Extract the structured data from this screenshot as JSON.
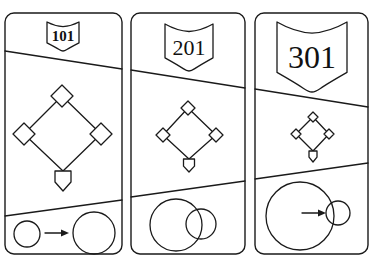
{
  "figure": {
    "colors": {
      "line": "#1a1a1a",
      "background": "#ffffff"
    }
  },
  "panels": [
    {
      "id": "panel-1",
      "shield_label": "101",
      "card": {
        "x": 5,
        "y": 13,
        "w": 117,
        "h": 241,
        "r": 9
      },
      "shield": {
        "cx": 63,
        "top": 22,
        "w": 32,
        "h": 29,
        "font_size": 15
      },
      "divider_top": {
        "x1": 5,
        "y1": 51,
        "x2": 122,
        "y2": 69
      },
      "divider_bottom": {
        "x1": 5,
        "y1": 216,
        "x2": 122,
        "y2": 200
      },
      "diamond": {
        "second": [
          62,
          96
        ],
        "first": [
          101,
          134
        ],
        "third": [
          24,
          134
        ],
        "home": [
          63,
          171
        ],
        "base_half": 11,
        "plate_w": 16,
        "plate_h": 20
      },
      "circles": [
        {
          "cx": 27,
          "cy": 234,
          "r": 13
        },
        {
          "cx": 94,
          "cy": 233,
          "r": 21
        }
      ],
      "arrow": {
        "x1": 45,
        "y1": 233,
        "x2": 69,
        "y2": 233
      }
    },
    {
      "id": "panel-2",
      "shield_label": "201",
      "card": {
        "x": 131,
        "y": 13,
        "w": 114,
        "h": 241,
        "r": 9
      },
      "shield": {
        "cx": 189,
        "top": 24,
        "w": 48,
        "h": 47,
        "font_size": 22
      },
      "divider_top": {
        "x1": 131,
        "y1": 70,
        "x2": 245,
        "y2": 88
      },
      "divider_bottom": {
        "x1": 131,
        "y1": 197,
        "x2": 245,
        "y2": 181
      },
      "diamond": {
        "second": [
          188,
          108
        ],
        "first": [
          216,
          135
        ],
        "third": [
          163,
          135
        ],
        "home": [
          189,
          159
        ],
        "base_half": 7,
        "plate_w": 11,
        "plate_h": 13
      },
      "circles": [
        {
          "cx": 176,
          "cy": 225,
          "r": 26
        },
        {
          "cx": 201,
          "cy": 224,
          "r": 15
        }
      ],
      "arrow": null
    },
    {
      "id": "panel-3",
      "shield_label": "301",
      "card": {
        "x": 255,
        "y": 13,
        "w": 113,
        "h": 241,
        "r": 9
      },
      "shield": {
        "cx": 312,
        "top": 22,
        "w": 70,
        "h": 70,
        "font_size": 32
      },
      "divider_top": {
        "x1": 255,
        "y1": 89,
        "x2": 368,
        "y2": 107
      },
      "divider_bottom": {
        "x1": 255,
        "y1": 179,
        "x2": 368,
        "y2": 163
      },
      "diamond": {
        "second": [
          313,
          117
        ],
        "first": [
          329,
          134
        ],
        "third": [
          296,
          134
        ],
        "home": [
          313,
          151
        ],
        "base_half": 5,
        "plate_w": 8,
        "plate_h": 11
      },
      "circles": [
        {
          "cx": 300,
          "cy": 216,
          "r": 34
        },
        {
          "cx": 338,
          "cy": 213,
          "r": 12
        }
      ],
      "arrow": {
        "x1": 302,
        "y1": 213,
        "x2": 326,
        "y2": 213
      }
    }
  ]
}
